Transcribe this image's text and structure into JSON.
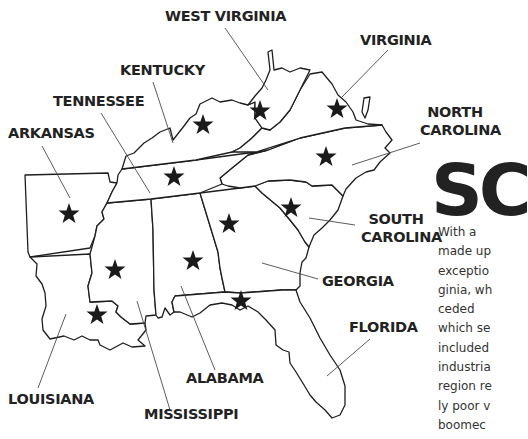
{
  "title": "SC",
  "body_lines": [
    "With a",
    "made up",
    "exceptio",
    "ginia, wh",
    "ceded",
    "which se",
    "included",
    "industria",
    "region re",
    "ly poor v",
    "boomec"
  ],
  "labels": {
    "west_virginia": "WEST VIRGINIA",
    "virginia": "VIRGINIA",
    "kentucky": "KENTUCKY",
    "tennessee": "TENNESSEE",
    "arkansas": "ARKANSAS",
    "north_carolina_1": "NORTH",
    "north_carolina_2": "CAROLINA",
    "south_carolina_1": "SOUTH",
    "south_carolina_2": "CAROLINA",
    "georgia": "GEORGIA",
    "florida": "FLORIDA",
    "alabama": "ALABAMA",
    "louisiana": "LOUISIANA",
    "mississippi": "MISSISSIPPI"
  },
  "map": {
    "states": [
      "Arkansas",
      "Louisiana",
      "Mississippi",
      "Alabama",
      "Georgia",
      "Florida",
      "South Carolina",
      "North Carolina",
      "Tennessee",
      "Kentucky",
      "Virginia",
      "West Virginia"
    ],
    "marker_icon": "star-icon",
    "star_count": 12
  }
}
